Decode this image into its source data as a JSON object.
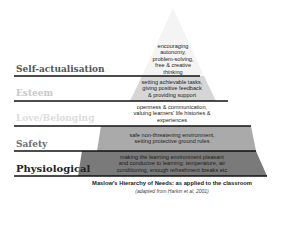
{
  "diagram": {
    "levels": [
      {
        "name": "Self-actualisation",
        "color": "#555555",
        "fill": "#f4f4f4",
        "lines": [
          "encouraging",
          "autonomy,",
          "problem-solving,",
          "free & creative",
          "thinking"
        ]
      },
      {
        "name": "Esteem",
        "color": "#c8c8c8",
        "fill": "#d6d6d6",
        "lines": [
          "setting achievable tasks,",
          "giving positive feedback",
          "& providing support"
        ]
      },
      {
        "name": "Love/Belonging",
        "color": "#dcdcdc",
        "fill": "#ffffff",
        "lines": [
          "openness & communication,",
          "valuing learners' life histories &",
          "experiences"
        ]
      },
      {
        "name": "Safety",
        "color": "#6e6e6e",
        "fill": "#aaaaaa",
        "lines": [
          "safe non-threatening environment,",
          "setting protective ground rules"
        ]
      },
      {
        "name": "Physiological",
        "color": "#222222",
        "fill": "#7a7a7a",
        "lines": [
          "making the learning environment pleasant",
          "and conducive to learning: temperature, air",
          "conditioning, enough refreshment breaks etc"
        ]
      }
    ]
  },
  "caption": {
    "title": "Maslow's Hierarchy of Needs: as applied to the classroom",
    "source": "(adapted from Harkin et al, 2001)"
  }
}
